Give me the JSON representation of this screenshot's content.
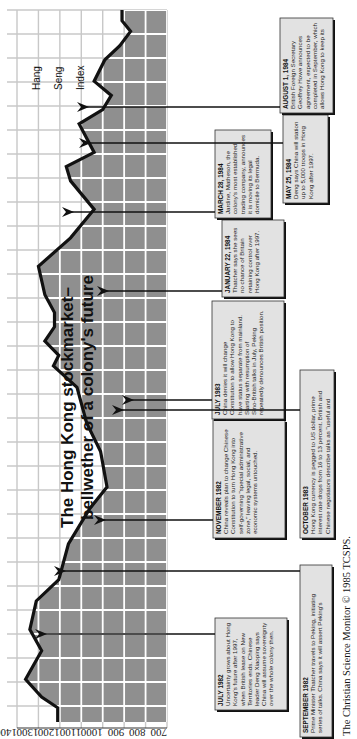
{
  "chart_data": {
    "type": "area",
    "orientation": "rotated-90-clockwise",
    "title": "The Hong Kong stockmarket–",
    "subtitle": "bellwether of a colony's future",
    "ylabel": "Hang Seng Index",
    "ylabel_lines": [
      "Hang",
      "Seng",
      "Index"
    ],
    "y_ticks": [
      1400,
      1300,
      1200,
      1100,
      1000,
      900,
      800,
      700
    ],
    "ylim": [
      700,
      1400
    ],
    "grid": true,
    "x_range": [
      "Jun 1982",
      "Aug 1984"
    ],
    "series": [
      {
        "name": "Hang Seng Index",
        "points": [
          {
            "t": 0.0,
            "v": 1210
          },
          {
            "t": 0.02,
            "v": 1210
          },
          {
            "t": 0.035,
            "v": 1285
          },
          {
            "t": 0.06,
            "v": 1360
          },
          {
            "t": 0.1,
            "v": 1285
          },
          {
            "t": 0.13,
            "v": 1340
          },
          {
            "t": 0.17,
            "v": 1310
          },
          {
            "t": 0.2,
            "v": 1205
          },
          {
            "t": 0.25,
            "v": 1160
          },
          {
            "t": 0.3,
            "v": 1060
          },
          {
            "t": 0.33,
            "v": 980
          },
          {
            "t": 0.38,
            "v": 1010
          },
          {
            "t": 0.42,
            "v": 1075
          },
          {
            "t": 0.47,
            "v": 1120
          },
          {
            "t": 0.5,
            "v": 1230
          },
          {
            "t": 0.515,
            "v": 1205
          },
          {
            "t": 0.535,
            "v": 1270
          },
          {
            "t": 0.555,
            "v": 1225
          },
          {
            "t": 0.575,
            "v": 1225
          },
          {
            "t": 0.6,
            "v": 1270
          },
          {
            "t": 0.64,
            "v": 1300
          },
          {
            "t": 0.68,
            "v": 1150
          },
          {
            "t": 0.72,
            "v": 1040
          },
          {
            "t": 0.76,
            "v": 1150
          },
          {
            "t": 0.78,
            "v": 1170
          },
          {
            "t": 0.8,
            "v": 1040
          },
          {
            "t": 0.84,
            "v": 1110
          },
          {
            "t": 0.86,
            "v": 1000
          },
          {
            "t": 0.88,
            "v": 960
          },
          {
            "t": 0.9,
            "v": 1040
          },
          {
            "t": 0.93,
            "v": 990
          },
          {
            "t": 0.95,
            "v": 920
          },
          {
            "t": 0.97,
            "v": 870
          },
          {
            "t": 0.985,
            "v": 910
          },
          {
            "t": 1.0,
            "v": 910
          }
        ]
      }
    ],
    "annotations": [
      {
        "date": "JULY 1982",
        "text": "Uncertainty grows about Hong Kong's future after 1997, when British lease on New Territories ends. Chinese leader Deng Xiaoping says China will assume sovereignty over the whole colony then.",
        "t": 0.06,
        "v": 1360
      },
      {
        "date": "SEPTEMBER 1982",
        "text": "Prime Minister Thatcher travels to Peking, initiating series of talks. China says it will assert Peking's control over Hong Kong in 1997.",
        "t": 0.17,
        "v": 1310
      },
      {
        "date": "NOVEMBER 1982",
        "text": "China reveals plan to change Chinese Constitution to turn Hong Kong into self-governing \"special administrative zone,\" leaving legal, social, and economic systems untouched.",
        "t": 0.25,
        "v": 1160
      },
      {
        "date": "JULY 1983",
        "text": "China denies it will change Constitution to allow Hong Kong to have status separate from mainland. Starting with resumption of Sino-British talks in July, Peking repeatedly denounces British position.",
        "t": 0.38,
        "v": 1010
      },
      {
        "date": "OCTOBER 1983",
        "text": "Hong Kong currency is pegged to US dollar, prime interest rate drops from 16 to 13 percent. British and Chinese negotiators describe talks as \"useful and constructive.\"",
        "t": 0.47,
        "v": 1120
      },
      {
        "date": "JANUARY 22, 1984",
        "text": "Thatcher says she sees no chance of Britain retaining control over Hong Kong after 1997.",
        "t": 0.64,
        "v": 1300
      },
      {
        "date": "MARCH 28, 1984",
        "text": "Jardine, Matheson, the colony's most established trading company, announces it is moving its legal domicile to Bermuda.",
        "t": 0.76,
        "v": 1150
      },
      {
        "date": "MAY 25, 1984",
        "text": "Deng says China will station up to 5,000 troops in Hong Kong after 1997.",
        "t": 0.88,
        "v": 960
      },
      {
        "date": "AUGUST 1, 1984",
        "text": "British Foreign Secretary Geoffrey Howe announces agreement, expected to be completed in September, which allows Hong Kong to keep its own legal system and laws, decide its own economic and trade policies, manage its own financial affairs, and retain free rights of travel.",
        "t": 0.95,
        "v": 920
      }
    ],
    "credit": "The Christian Science Monitor © 1985 TCSPS."
  }
}
